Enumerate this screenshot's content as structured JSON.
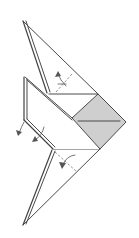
{
  "diagram": {
    "type": "origami-fold-diagram",
    "colors": {
      "background": "#ffffff",
      "line": "#4a4a4a",
      "shaded_flap": "#cfcfcf",
      "fold_line": "#666666"
    },
    "elements": {
      "upper_flap": {
        "label": "upper-triangular-flap"
      },
      "lower_flap": {
        "label": "lower-triangular-flap"
      },
      "center_body": {
        "label": "center-trapezoid-body"
      },
      "shaded_square": {
        "label": "shaded-square-flap",
        "has_center_line": true
      },
      "left_edge": {
        "label": "double-layer-left-edge"
      },
      "fold_lines": [
        {
          "label": "upper-valley-fold",
          "style": "dashed"
        },
        {
          "label": "lower-valley-fold",
          "style": "dashed"
        }
      ],
      "arrows": [
        {
          "label": "upper-fold-arrow",
          "direction": "fold-in"
        },
        {
          "label": "left-fold-arrow-1",
          "direction": "fold-behind"
        },
        {
          "label": "left-fold-arrow-2",
          "direction": "fold-behind"
        },
        {
          "label": "lower-fold-arrow",
          "direction": "fold-in"
        }
      ]
    }
  }
}
